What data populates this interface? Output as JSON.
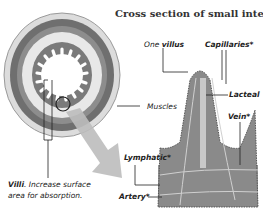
{
  "diagram": {
    "title": "Cross section of small intestine",
    "labels": {
      "one": "One",
      "villus": "villus",
      "capillaries": "Capillaries*",
      "lacteal": "Lacteal",
      "muscles": "Muscles",
      "vein": "Vein*",
      "lymphatic": "Lymphatic*",
      "artery": "Artery*",
      "villi_bold": "Villi",
      "villi_desc_1": ". Increase surface",
      "villi_desc_2": "area for absorption."
    },
    "colors": {
      "outer": "#d9d9d9",
      "muscle_dark": "#6a6a6a",
      "muscle_mid": "#8c8c8c",
      "submucosa": "#e6e6e6",
      "mucosa": "#7a7a7a",
      "arrow": "#bdbdbd",
      "tissue": "#8a8a8a"
    }
  }
}
